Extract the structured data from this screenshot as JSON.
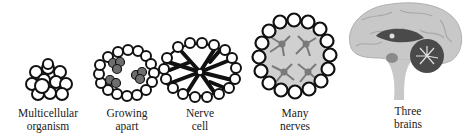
{
  "diagram": {
    "type": "evolution-sequence",
    "stages": [
      {
        "id": "multicellular",
        "line1": "Multicellular",
        "line2": "organism"
      },
      {
        "id": "growing-apart",
        "line1": "Growing",
        "line2": "apart"
      },
      {
        "id": "nerve-cell",
        "line1": "Nerve",
        "line2": "cell"
      },
      {
        "id": "many-nerves",
        "line1": "Many",
        "line2": "nerves"
      },
      {
        "id": "three-brains",
        "line1": "Three",
        "line2": "brains"
      }
    ],
    "colors": {
      "outline": "#111111",
      "cell_fill": "#ffffff",
      "dark_cell": "#6e6e6e",
      "neuron_bg": "#d0d0d0",
      "neuron": "#7a7a7a",
      "brain_light": "#c8c8c8",
      "brain_dark": "#4a4a4a"
    }
  }
}
